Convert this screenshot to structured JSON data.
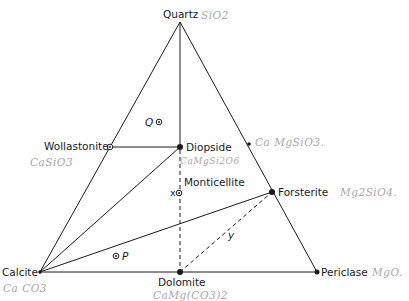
{
  "diagram": {
    "type": "ternary-phase-diagram",
    "vertices": {
      "top": "Quartz",
      "left": "Calcite",
      "right": "Periclase"
    },
    "phases": [
      {
        "id": "quartz",
        "label": "Quartz",
        "formula": "SiO2"
      },
      {
        "id": "wollastonite",
        "label": "Wollastonite",
        "formula": "CaSiO3"
      },
      {
        "id": "diopside",
        "label": "Diopside",
        "formula": "CaMgSi2O6"
      },
      {
        "id": "monticellite",
        "label": "Monticellite",
        "formula": ""
      },
      {
        "id": "forsterite",
        "label": "Forsterite",
        "formula": "Mg2SiO4"
      },
      {
        "id": "calcite",
        "label": "Calcite",
        "formula": "CaCO3"
      },
      {
        "id": "dolomite",
        "label": "Dolomite",
        "formula": "CaMg(CO3)2"
      },
      {
        "id": "periclase",
        "label": "Periclase",
        "formula": "MgO"
      },
      {
        "id": "enstatite",
        "label": "",
        "formula": "Ca MgSiO3"
      }
    ],
    "handwritten": {
      "quartz": "SiO2",
      "wollastonite": "CaSiO3",
      "diopside": "CaMgSi2O6",
      "enstatite": "Ca MgSiO3.",
      "forsterite": "Mg2SiO4.",
      "calcite": "Ca CO3",
      "dolomite": "CaMg(CO3)2",
      "periclase": "MgO."
    },
    "points": {
      "q": "Q",
      "p": "P",
      "x": "x",
      "y": "y"
    },
    "tie_lines": [
      {
        "from": "quartz",
        "to": "calcite",
        "style": "solid"
      },
      {
        "from": "quartz",
        "to": "periclase",
        "style": "solid"
      },
      {
        "from": "calcite",
        "to": "periclase",
        "style": "solid"
      },
      {
        "from": "quartz",
        "to": "diopside",
        "style": "solid"
      },
      {
        "from": "wollastonite",
        "to": "diopside",
        "style": "solid"
      },
      {
        "from": "calcite",
        "to": "diopside",
        "style": "solid"
      },
      {
        "from": "calcite",
        "to": "forsterite",
        "style": "solid"
      },
      {
        "from": "diopside",
        "to": "dolomite",
        "style": "dashed"
      },
      {
        "from": "dolomite",
        "to": "forsterite",
        "style": "dashed"
      }
    ]
  }
}
